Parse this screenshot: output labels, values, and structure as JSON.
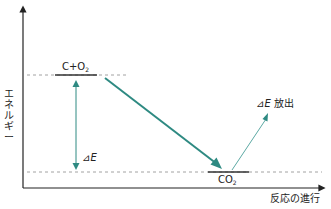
{
  "diagram": {
    "title": "",
    "y_axis_label": "エネルギー",
    "y_axis_chars": [
      "エ",
      "ネ",
      "ル",
      "ギ",
      "ー"
    ],
    "x_axis_label": "反応の進行",
    "levels": {
      "reactant": {
        "main": "C+O",
        "sub": "2"
      },
      "product": {
        "main": "CO",
        "sub": "2"
      }
    },
    "delta_label": {
      "symbol": "⊿",
      "var": "E"
    },
    "release_label": {
      "symbol": "⊿",
      "var": "E",
      "text": " 放出"
    },
    "colors": {
      "axis": "#222222",
      "level_bar": "#333333",
      "dashed": "#8a8a8a",
      "arrow_teal": "#2e8a82",
      "arrow_teal_light": "#4a9e98"
    }
  }
}
